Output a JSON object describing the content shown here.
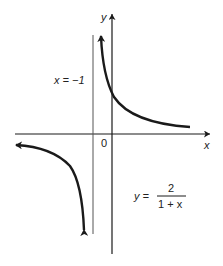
{
  "figure": {
    "type": "function-graph",
    "function": "y = 2/(1 + x)",
    "labels": {
      "y_axis": "y",
      "x_axis": "x",
      "origin": "0",
      "asymptote": "x = −1",
      "equation_lhs": "y =",
      "equation_numerator": "2",
      "equation_denominator": "1 + x"
    },
    "vertical_asymptote": -1,
    "horizontal_asymptote": 0,
    "y_intercept": 2,
    "colors": {
      "ink": "#1a1a1a",
      "asymptote": "#555555",
      "background": "#ffffff"
    }
  }
}
